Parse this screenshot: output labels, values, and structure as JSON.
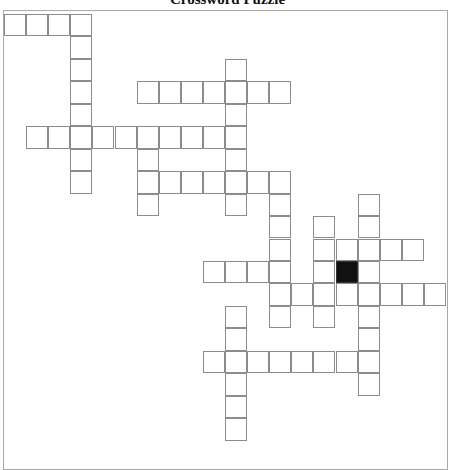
{
  "puzzle": {
    "title": "Crossword Puzzle",
    "grid": {
      "origin_x": 4,
      "origin_y": 14,
      "cell_w": 22.1,
      "cell_h": 22.45,
      "colors": {
        "cell_border": "#8c8c8c",
        "cell_fill": "#ffffff",
        "block_fill": "#111111",
        "frame": "#a8a8a8"
      },
      "entries": [
        {
          "dir": "across",
          "row": 0,
          "col": 0,
          "len": 4
        },
        {
          "dir": "down",
          "row": 0,
          "col": 3,
          "len": 8
        },
        {
          "dir": "down",
          "row": 2,
          "col": 10,
          "len": 7
        },
        {
          "dir": "across",
          "row": 3,
          "col": 6,
          "len": 7
        },
        {
          "dir": "across",
          "row": 5,
          "col": 1,
          "len": 10
        },
        {
          "dir": "down",
          "row": 5,
          "col": 6,
          "len": 4
        },
        {
          "dir": "across",
          "row": 7,
          "col": 6,
          "len": 7
        },
        {
          "dir": "down",
          "row": 7,
          "col": 12,
          "len": 7
        },
        {
          "dir": "down",
          "row": 8,
          "col": 16,
          "len": 9
        },
        {
          "dir": "down",
          "row": 9,
          "col": 14,
          "len": 5
        },
        {
          "dir": "across",
          "row": 10,
          "col": 14,
          "len": 5
        },
        {
          "dir": "across",
          "row": 11,
          "col": 9,
          "len": 4
        },
        {
          "dir": "across",
          "row": 12,
          "col": 12,
          "len": 8
        },
        {
          "dir": "down",
          "row": 10,
          "col": 15,
          "len": 3
        },
        {
          "dir": "down",
          "row": 13,
          "col": 10,
          "len": 6
        },
        {
          "dir": "across",
          "row": 15,
          "col": 9,
          "len": 8
        }
      ],
      "blocks": [
        {
          "row": 11,
          "col": 15
        }
      ]
    }
  }
}
